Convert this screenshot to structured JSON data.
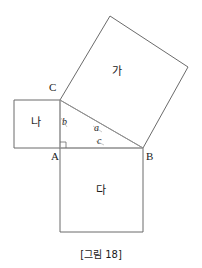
{
  "figure": {
    "caption": "[그림 18]",
    "colors": {
      "square_stroke": "#6b6b6b",
      "triangle_stroke": "#9a9a9a",
      "hypotenuse_stroke": "#555555",
      "text": "#1a1a1a",
      "background": "#ffffff"
    },
    "vertices": [
      {
        "name": "A",
        "label": "A",
        "x": 60,
        "y": 148,
        "label_x": 52,
        "label_y": 152
      },
      {
        "name": "B",
        "label": "B",
        "x": 143,
        "y": 148,
        "label_x": 147,
        "label_y": 152
      },
      {
        "name": "C",
        "label": "C",
        "x": 60,
        "y": 100,
        "label_x": 49,
        "label_y": 85
      }
    ],
    "side_labels": [
      {
        "name": "a",
        "label": "a",
        "x": 95,
        "y": 122
      },
      {
        "name": "b",
        "label": "b",
        "x": 62,
        "y": 115
      },
      {
        "name": "c",
        "label": "c",
        "x": 97,
        "y": 136
      }
    ],
    "regions": [
      {
        "name": "ga",
        "label": "가",
        "x": 112,
        "y": 66
      },
      {
        "name": "na",
        "label": "나",
        "x": 31,
        "y": 117
      },
      {
        "name": "da",
        "label": "다",
        "x": 96,
        "y": 185
      }
    ],
    "squares": {
      "ga_points": "60,100 110,16 188,67 143,148",
      "na_points": "14,100 60,100 60,148 14,148",
      "da_points": "60,148 143,148 143,232 60,232"
    },
    "triangle": {
      "leg_b": {
        "x1": 60,
        "y1": 100,
        "x2": 60,
        "y2": 148
      },
      "leg_c": {
        "x1": 60,
        "y1": 148,
        "x2": 143,
        "y2": 148
      },
      "hypotenuse_a": {
        "x1": 60,
        "y1": 100,
        "x2": 143,
        "y2": 148
      }
    },
    "right_angle_marker": {
      "x": 60,
      "y": 148,
      "size": 6
    },
    "tick_marks": {
      "b_tick": {
        "x1": 61,
        "y1": 118,
        "x2": 67,
        "y2": 127
      },
      "a_tick_lower": {
        "x1": 93,
        "y1": 125,
        "x2": 99,
        "y2": 131
      },
      "c_tick": {
        "x1": 96,
        "y1": 140,
        "x2": 102,
        "y2": 145
      }
    }
  }
}
